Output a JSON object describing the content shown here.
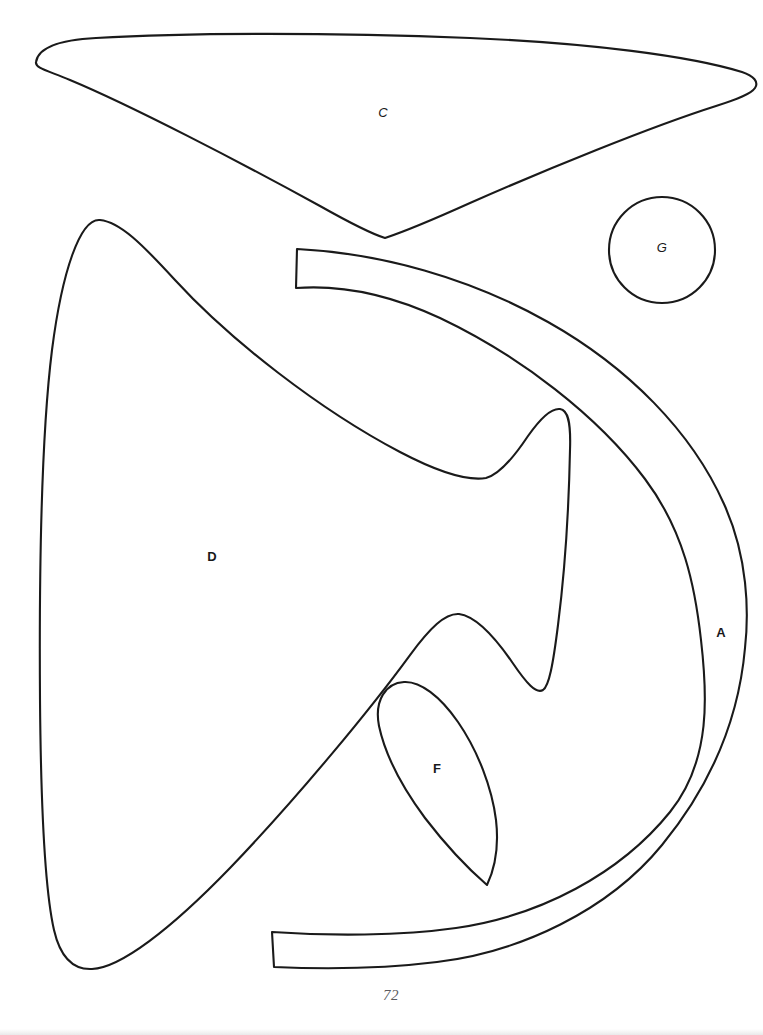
{
  "document": {
    "kind": "sewing-pattern-template-page",
    "page_number": "72",
    "background_color": "#ffffff",
    "ink_color": "#1a1a1a",
    "page_number_color": "#5a5a5e"
  },
  "pieces": [
    {
      "id": "C",
      "label": "C",
      "name": "piece-c-wing-triangle",
      "description": "Large curved triangular wedge across the top of the page",
      "label_x": 383,
      "label_y": 112,
      "label_style": "italic"
    },
    {
      "id": "G",
      "label": "G",
      "name": "piece-g-circle",
      "description": "Small circle at upper right",
      "label_x": 662,
      "label_y": 247,
      "label_style": "italic"
    },
    {
      "id": "A",
      "label": "A",
      "name": "piece-a-crescent-band",
      "description": "Long curved crescent band sweeping down the right side",
      "label_x": 721,
      "label_y": 632,
      "label_style": "upright"
    },
    {
      "id": "D",
      "label": "D",
      "name": "piece-d-large-wing",
      "description": "Large wing shape filling the left and centre of the page with a notched right edge",
      "label_x": 212,
      "label_y": 556,
      "label_style": "upright"
    },
    {
      "id": "F",
      "label": "F",
      "name": "piece-f-leaf",
      "description": "Small pointed leaf shape near the lower centre",
      "label_x": 437,
      "label_y": 768,
      "label_style": "upright"
    }
  ]
}
